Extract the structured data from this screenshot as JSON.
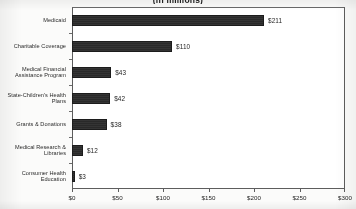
{
  "chart_data": {
    "type": "bar",
    "orientation": "horizontal",
    "title": "(in millions)",
    "xlabel": "",
    "ylabel": "",
    "categories": [
      "Medicaid",
      "Charitable Coverage",
      "Medical Financial Assistance Program",
      "State-Children's Health Plans",
      "Grants & Donations",
      "Medical Research & Libraries",
      "Consumer Health Education"
    ],
    "values": [
      211,
      110,
      43,
      42,
      38,
      12,
      3
    ],
    "value_labels": [
      "$211",
      "$110",
      "$43",
      "$42",
      "$38",
      "$12",
      "$3"
    ],
    "xlim": [
      0,
      300
    ],
    "xticks": [
      0,
      50,
      100,
      150,
      200,
      250,
      300
    ],
    "xtick_labels": [
      "$0",
      "$50",
      "$100",
      "$150",
      "$200",
      "$250",
      "$300"
    ],
    "grid": false,
    "legend": false,
    "bar_color": "#2e2e2e",
    "axis_color": "#5d5d5d",
    "background": "#ffffff"
  }
}
